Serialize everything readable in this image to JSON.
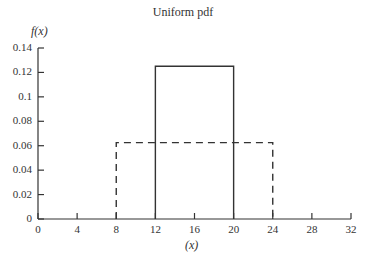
{
  "chart_data": {
    "type": "line",
    "title": "Uniform pdf",
    "xlabel": "(x)",
    "ylabel": "f(x)",
    "xlim": [
      0,
      32
    ],
    "ylim": [
      0,
      0.14
    ],
    "xticks": [
      "0",
      "4",
      "8",
      "12",
      "16",
      "20",
      "24",
      "28",
      "32"
    ],
    "yticks": [
      "0",
      "0.02",
      "0.04",
      "0.06",
      "0.08",
      "0.1",
      "0.12",
      "0.14"
    ],
    "grid": false,
    "legend": null,
    "series": [
      {
        "name": "Uniform(12,20)",
        "style": "solid",
        "x": [
          12,
          12,
          20,
          20
        ],
        "y": [
          0,
          0.125,
          0.125,
          0
        ]
      },
      {
        "name": "Uniform(8,24)",
        "style": "dashed",
        "x": [
          8,
          8,
          24,
          24
        ],
        "y": [
          0,
          0.0625,
          0.0625,
          0
        ]
      }
    ]
  }
}
